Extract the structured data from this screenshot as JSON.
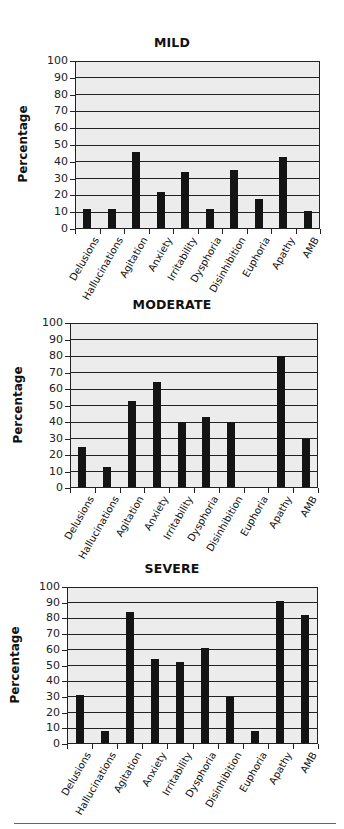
{
  "chart_data": [
    {
      "type": "bar",
      "title": "MILD",
      "xlabel": "",
      "ylabel": "Percentage",
      "ylim": [
        0,
        100
      ],
      "yticks": [
        0,
        10,
        20,
        30,
        40,
        50,
        60,
        70,
        80,
        90,
        100
      ],
      "grid": true,
      "categories": [
        "Delusions",
        "Hallucinations",
        "Agitation",
        "Anxiety",
        "Irritability",
        "Dysphoria",
        "Disinhibition",
        "Euphoria",
        "Apathy",
        "AMB"
      ],
      "values": [
        12,
        12,
        46,
        22,
        34,
        12,
        35,
        18,
        43,
        11
      ]
    },
    {
      "type": "bar",
      "title": "MODERATE",
      "xlabel": "",
      "ylabel": "Percentage",
      "ylim": [
        0,
        100
      ],
      "yticks": [
        0,
        10,
        20,
        30,
        40,
        50,
        60,
        70,
        80,
        90,
        100
      ],
      "grid": true,
      "categories": [
        "Delusions",
        "Hallucinations",
        "Agitation",
        "Anxiety",
        "Irritability",
        "Dysphoria",
        "Disinhibition",
        "Euphoria",
        "Apathy",
        "AMB"
      ],
      "values": [
        25,
        13,
        53,
        64,
        40,
        43,
        40,
        0,
        80,
        30
      ]
    },
    {
      "type": "bar",
      "title": "SEVERE",
      "xlabel": "",
      "ylabel": "Percentage",
      "ylim": [
        0,
        100
      ],
      "yticks": [
        0,
        10,
        20,
        30,
        40,
        50,
        60,
        70,
        80,
        90,
        100
      ],
      "grid": true,
      "categories": [
        "Delusions",
        "Hallucinations",
        "Agitation",
        "Anxiety",
        "Irritability",
        "Dysphoria",
        "Disinhibition",
        "Euphoria",
        "Apathy",
        "AMB"
      ],
      "values": [
        31,
        8,
        84,
        54,
        52,
        61,
        30,
        8,
        91,
        82
      ]
    }
  ],
  "layout": [
    {
      "title_top": 35,
      "plot_left": 75,
      "plot_top": 61,
      "plot_right": 320,
      "plot_bottom": 229,
      "ytitle_left": 8
    },
    {
      "title_top": 297,
      "plot_left": 70,
      "plot_top": 323,
      "plot_right": 318,
      "plot_bottom": 488,
      "ytitle_left": 3
    },
    {
      "title_top": 561,
      "plot_left": 67,
      "plot_top": 587,
      "plot_right": 318,
      "plot_bottom": 744,
      "ytitle_left": 0
    }
  ],
  "colors": {
    "bar": "#141414",
    "plot_background": "#ececec",
    "grid": "#222222"
  }
}
